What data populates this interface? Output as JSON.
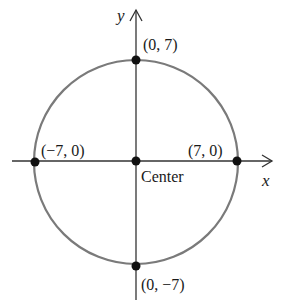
{
  "diagram": {
    "axes": {
      "x_label": "x",
      "y_label": "y"
    },
    "circle": {
      "center": [
        0,
        0
      ],
      "radius": 7,
      "stroke_color": "#777777"
    },
    "points": [
      {
        "id": "top",
        "coords": [
          0,
          7
        ],
        "label": "(0, 7)"
      },
      {
        "id": "bottom",
        "coords": [
          0,
          -7
        ],
        "label": "(0, −7)"
      },
      {
        "id": "left",
        "coords": [
          -7,
          0
        ],
        "label": "(−7, 0)"
      },
      {
        "id": "right",
        "coords": [
          7,
          0
        ],
        "label": "(7, 0)"
      },
      {
        "id": "center",
        "coords": [
          0,
          0
        ],
        "label": "Center"
      }
    ],
    "colors": {
      "axis": "#333333",
      "point": "#111111",
      "text": "#1a1a1a"
    }
  }
}
